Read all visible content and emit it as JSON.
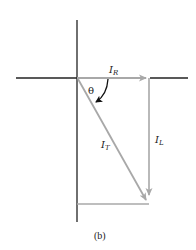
{
  "diagram": {
    "type": "phasor-diagram",
    "caption": "(b)",
    "labels": {
      "resistive_current": {
        "main": "I",
        "sub": "R"
      },
      "inductive_current": {
        "main": "I",
        "sub": "L"
      },
      "total_current": {
        "main": "I",
        "sub": "T"
      },
      "angle": "θ"
    },
    "colors": {
      "axis": "#222222",
      "phasor": "#a8a8a8",
      "angle_arrow": "#111111"
    },
    "geometry": {
      "origin": [
        77,
        78
      ],
      "i_r_tip": [
        148,
        78
      ],
      "i_l_tip": [
        148,
        202
      ],
      "i_t_tip": [
        148,
        202
      ]
    }
  }
}
